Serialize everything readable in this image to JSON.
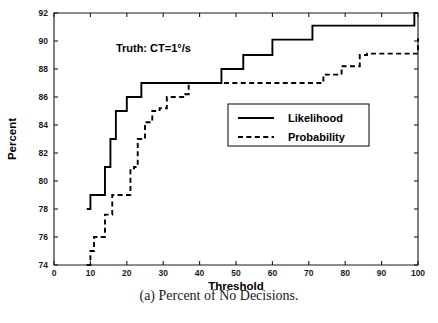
{
  "figure": {
    "caption": "(a) Percent of No Decisions.",
    "annotation": "Truth: CT=1°/s"
  },
  "chart_data": {
    "type": "line",
    "title": "",
    "subtitle": "",
    "xlabel": "Threshold",
    "ylabel": "Percent",
    "xlim": [
      0,
      100
    ],
    "ylim": [
      74,
      92
    ],
    "xticks": [
      0,
      10,
      20,
      30,
      40,
      50,
      60,
      70,
      80,
      90,
      100
    ],
    "yticks": [
      74,
      76,
      78,
      80,
      82,
      84,
      86,
      88,
      90,
      92
    ],
    "grid": false,
    "legend_position": "center-right",
    "annotations": [
      {
        "text": "Truth: CT=1°/s",
        "x": 17,
        "y": 89.2
      }
    ],
    "series": [
      {
        "name": "Likelihood",
        "style": "solid",
        "color": "#000000",
        "step": "post",
        "x": [
          9,
          10,
          13,
          14,
          15,
          15.5,
          16,
          17,
          19,
          20,
          23,
          24,
          45,
          46,
          51,
          52,
          54,
          57,
          60,
          68,
          71,
          72,
          91,
          92,
          99,
          100
        ],
        "y": [
          78,
          79,
          79,
          81,
          81,
          83,
          83,
          85,
          85,
          86,
          86,
          87,
          87,
          88,
          88,
          89,
          89,
          89,
          90.1,
          90.1,
          91.1,
          91.1,
          91.1,
          91.1,
          92,
          92
        ]
      },
      {
        "name": "Probability",
        "style": "dashed",
        "color": "#000000",
        "step": "post",
        "x": [
          9,
          10,
          11,
          13,
          14,
          16,
          17,
          20,
          21,
          22,
          23,
          25,
          27,
          29,
          31,
          33,
          36,
          37,
          45,
          72,
          74,
          79,
          84,
          86,
          91,
          100
        ],
        "y": [
          74,
          75,
          76,
          76,
          77.6,
          79,
          79,
          79,
          80.9,
          81,
          83,
          84.2,
          85,
          85.2,
          86,
          86,
          86.2,
          87,
          87,
          87,
          87.6,
          88.2,
          89,
          89.1,
          89.1,
          90.2
        ]
      }
    ]
  },
  "legend": {
    "entries": [
      {
        "label": "Likelihood",
        "style": "solid"
      },
      {
        "label": "Probability",
        "style": "dashed"
      }
    ]
  }
}
